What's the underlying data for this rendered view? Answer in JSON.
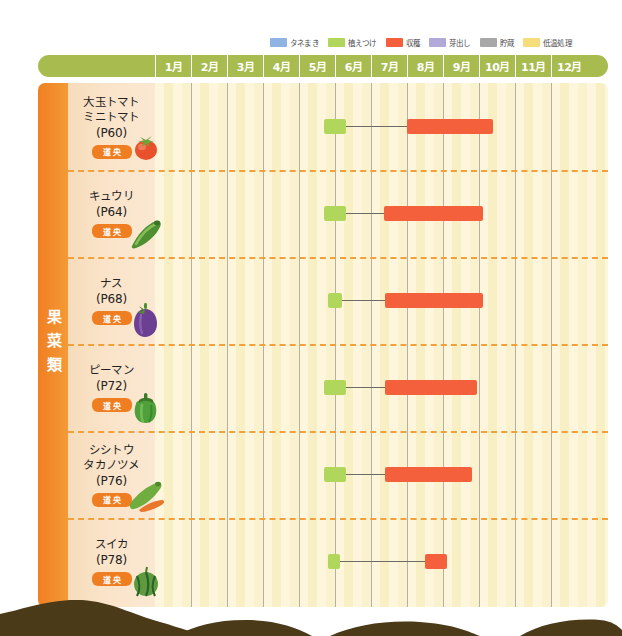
{
  "legend": {
    "items": [
      {
        "label": "タネまき",
        "color": "#8fb4e3",
        "name": "sowing"
      },
      {
        "label": "植えつけ",
        "color": "#b0d75c",
        "name": "planting"
      },
      {
        "label": "収穫",
        "color": "#f4603c",
        "name": "harvest"
      },
      {
        "label": "芽出し",
        "color": "#b3a9d8",
        "name": "sprouting"
      },
      {
        "label": "貯蔵",
        "color": "#a8a8a8",
        "name": "storage"
      },
      {
        "label": "低温処理",
        "color": "#f4dd7a",
        "name": "cold-treatment"
      }
    ]
  },
  "months": [
    "1月",
    "2月",
    "3月",
    "4月",
    "5月",
    "6月",
    "7月",
    "8月",
    "9月",
    "10月",
    "11月",
    "12月"
  ],
  "category": {
    "label": "果菜類"
  },
  "region_badge": "道央",
  "rows": [
    {
      "name": "tomato",
      "title_lines": [
        "大玉トマト",
        "ミニトマト"
      ],
      "page": "(P60)",
      "badge": "道央",
      "icon": "tomato-icon"
    },
    {
      "name": "cucumber",
      "title_lines": [
        "キュウリ"
      ],
      "page": "(P64)",
      "badge": "道央",
      "icon": "cucumber-icon"
    },
    {
      "name": "eggplant",
      "title_lines": [
        "ナス"
      ],
      "page": "(P68)",
      "badge": "道央",
      "icon": "eggplant-icon"
    },
    {
      "name": "bell-pepper",
      "title_lines": [
        "ピーマン"
      ],
      "page": "(P72)",
      "badge": "道央",
      "icon": "bell-pepper-icon"
    },
    {
      "name": "shishito",
      "title_lines": [
        "シシトウ",
        "タカノツメ"
      ],
      "page": "(P76)",
      "badge": "道央",
      "icon": "chili-icon"
    },
    {
      "name": "watermelon",
      "title_lines": [
        "スイカ"
      ],
      "page": "(P78)",
      "badge": "道央",
      "icon": "watermelon-icon"
    }
  ],
  "chart_data": {
    "type": "bar",
    "xlabel": "月",
    "ylabel": "野菜",
    "xlim": [
      1,
      13
    ],
    "categories": [
      "大玉トマト・ミニトマト (P60)",
      "キュウリ (P64)",
      "ナス (P68)",
      "ピーマン (P72)",
      "シシトウ・タカノツメ (P76)",
      "スイカ (P78)"
    ],
    "legend_position": "top-right",
    "grid": true,
    "series": [
      {
        "name": "植えつけ",
        "color": "#b0d75c",
        "spans": [
          {
            "category": "大玉トマト・ミニトマト (P60)",
            "start_month": 5.7,
            "end_month": 6.3
          },
          {
            "category": "キュウリ (P64)",
            "start_month": 5.7,
            "end_month": 6.3
          },
          {
            "category": "ナス (P68)",
            "start_month": 5.8,
            "end_month": 6.2
          },
          {
            "category": "ピーマン (P72)",
            "start_month": 5.7,
            "end_month": 6.3
          },
          {
            "category": "シシトウ・タカノツメ (P76)",
            "start_month": 5.7,
            "end_month": 6.3
          },
          {
            "category": "スイカ (P78)",
            "start_month": 5.8,
            "end_month": 6.15
          }
        ]
      },
      {
        "name": "収穫",
        "color": "#f4603c",
        "spans": [
          {
            "category": "大玉トマト・ミニトマト (P60)",
            "start_month": 8.0,
            "end_month": 10.4
          },
          {
            "category": "キュウリ (P64)",
            "start_month": 7.35,
            "end_month": 10.1
          },
          {
            "category": "ナス (P68)",
            "start_month": 7.4,
            "end_month": 10.1
          },
          {
            "category": "ピーマン (P72)",
            "start_month": 7.4,
            "end_month": 9.95
          },
          {
            "category": "シシトウ・タカノツメ (P76)",
            "start_month": 7.4,
            "end_month": 9.8
          },
          {
            "category": "スイカ (P78)",
            "start_month": 8.5,
            "end_month": 9.1
          }
        ]
      }
    ],
    "connectors": [
      {
        "category": "大玉トマト・ミニトマト (P60)",
        "from_month": 6.3,
        "to_month": 8.0
      },
      {
        "category": "キュウリ (P64)",
        "from_month": 6.3,
        "to_month": 7.35
      },
      {
        "category": "ナス (P68)",
        "from_month": 6.2,
        "to_month": 7.4
      },
      {
        "category": "ピーマン (P72)",
        "from_month": 6.3,
        "to_month": 7.4
      },
      {
        "category": "シシトウ・タカノツメ (P76)",
        "from_month": 6.3,
        "to_month": 7.4
      },
      {
        "category": "スイカ (P78)",
        "from_month": 6.15,
        "to_month": 8.5
      }
    ]
  }
}
